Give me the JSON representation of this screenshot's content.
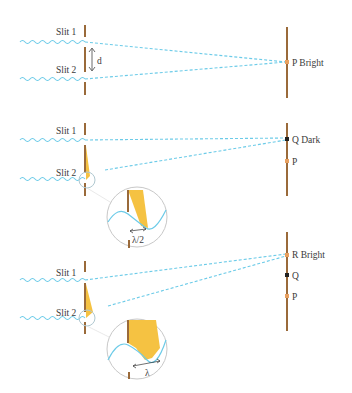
{
  "panels": [
    {
      "id": "panel-1",
      "slit1_label": "Slit 1",
      "slit2_label": "Slit 2",
      "separation_label": "d",
      "screen_points": [
        {
          "label": "P Bright",
          "color": "#e8a060"
        }
      ]
    },
    {
      "id": "panel-2",
      "slit1_label": "Slit 1",
      "slit2_label": "Slit 2",
      "path_difference_label": "λ/2",
      "screen_points": [
        {
          "label": "Q Dark",
          "color": "#222222"
        },
        {
          "label": "P",
          "color": "#e8a060"
        }
      ]
    },
    {
      "id": "panel-3",
      "slit1_label": "Slit 1",
      "slit2_label": "Slit 2",
      "path_difference_label": "λ",
      "screen_points": [
        {
          "label": "R Bright",
          "color": "#e8a060"
        },
        {
          "label": "Q",
          "color": "#222222"
        },
        {
          "label": "P",
          "color": "#e8a060"
        }
      ]
    }
  ],
  "colors": {
    "wave": "#6ccbe8",
    "barrier": "#9a6a3a",
    "path_fill": "#f5c242",
    "magnifier": "#c8c8c8"
  }
}
